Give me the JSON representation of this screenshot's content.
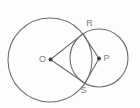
{
  "figure": {
    "background": "#fdfdfd",
    "stroke_color": "#6e6e6e",
    "label_color": "#7d7d7d",
    "dot_color": "#3a3a3a",
    "width": 140,
    "height": 108,
    "circles": [
      {
        "name": "circle-O",
        "cx": 50,
        "cy": 60,
        "r": 42
      },
      {
        "name": "circle-P",
        "cx": 99,
        "cy": 58,
        "r": 29
      }
    ],
    "points": {
      "O": {
        "x": 50.5,
        "y": 59.5,
        "dot": true,
        "label": "O",
        "label_x": 42.5,
        "label_y": 59.5
      },
      "P": {
        "x": 99,
        "y": 58.5,
        "dot": true,
        "label": "P",
        "label_x": 106.5,
        "label_y": 58.5
      },
      "R": {
        "x": 82.9,
        "y": 33.9,
        "dot": false,
        "label": "R",
        "label_x": 89.5,
        "label_y": 24
      },
      "S": {
        "x": 84.9,
        "y": 83.3,
        "dot": false,
        "label": "S",
        "label_x": 83.5,
        "label_y": 91
      }
    },
    "segments": [
      {
        "from": "O",
        "to": "R"
      },
      {
        "from": "O",
        "to": "S"
      },
      {
        "from": "P",
        "to": "R"
      },
      {
        "from": "P",
        "to": "S"
      }
    ]
  }
}
